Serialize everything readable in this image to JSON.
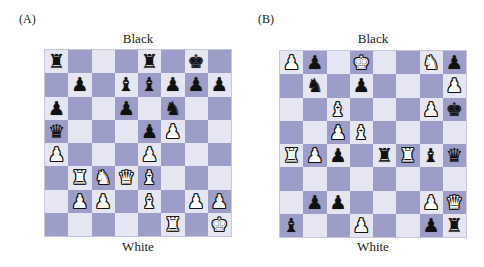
{
  "colors": {
    "light_square": "#e6e6f3",
    "dark_square": "#9d9dc9"
  },
  "glyphs": {
    "K": "♚",
    "Q": "♛",
    "R": "♜",
    "B": "♝",
    "N": "♞",
    "P": "♟",
    "k": "♚",
    "q": "♛",
    "r": "♜",
    "b": "♝",
    "n": "♞",
    "p": "♟"
  },
  "boards": [
    {
      "label": "(A)",
      "top_label": "Black",
      "bottom_label": "White",
      "ranks": [
        "r...r.k.",
        ".p.bbppp",
        "p..p.n..",
        "q...pP..",
        "P...P...",
        ".RNQB...",
        ".PP.B.PP",
        ".....R.K"
      ]
    },
    {
      "label": "(B)",
      "top_label": "Black",
      "bottom_label": "White",
      "ranks": [
        "Pp.K..Np",
        ".n.p...P",
        "..B...Pk",
        "..PB....",
        "RPp.rRbq",
        "........",
        ".pp...PQ",
        "b..P..pr"
      ]
    }
  ]
}
